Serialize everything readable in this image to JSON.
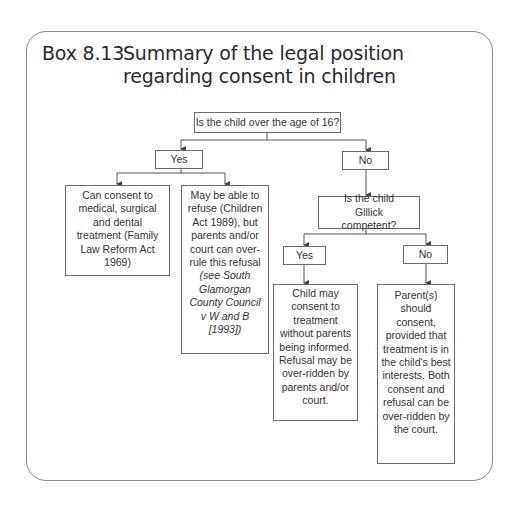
{
  "title": {
    "label": "Box 8.13",
    "text": "Summary of the legal position regarding consent in children"
  },
  "flowchart": {
    "root": {
      "text": "Is the child over the age of 16?"
    },
    "yes": {
      "label": "Yes"
    },
    "no": {
      "label": "No"
    },
    "yes_outcome_consent": {
      "text": "Can consent to medical, surgical and dental treatment (Family Law Reform Act 1969)"
    },
    "yes_outcome_refuse": {
      "text": "May be able to refuse (Children Act 1989), but parents and/or court can over-rule this refusal",
      "citation": "(see South Glamorgan County Council v W and B [1993])"
    },
    "gillick_question": {
      "text": "Is the child Gillick competent?"
    },
    "gillick_yes": {
      "label": "Yes"
    },
    "gillick_no": {
      "label": "No"
    },
    "gillick_yes_outcome": {
      "text": "Child may consent to treatment without parents being informed. Refusal may be over-ridden by parents and/or court."
    },
    "gillick_no_outcome": {
      "text": "Parent(s) should consent, provided that treatment is in the child's best interests. Both consent and refusal can be over-ridden by the court."
    }
  }
}
